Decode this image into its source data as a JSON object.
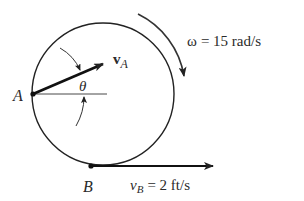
{
  "diagram": {
    "point_a_label": "A",
    "point_b_label": "B",
    "velocity_a": {
      "symbol": "v",
      "subscript": "A"
    },
    "velocity_b": {
      "symbol": "v",
      "subscript": "B",
      "equals": "= 2 ft/s"
    },
    "angular_velocity": {
      "symbol": "ω",
      "equals": "= 15 rad/s"
    },
    "angle_label": "θ",
    "colors": {
      "stroke": "#222222",
      "text": "#2a2a2a"
    }
  }
}
